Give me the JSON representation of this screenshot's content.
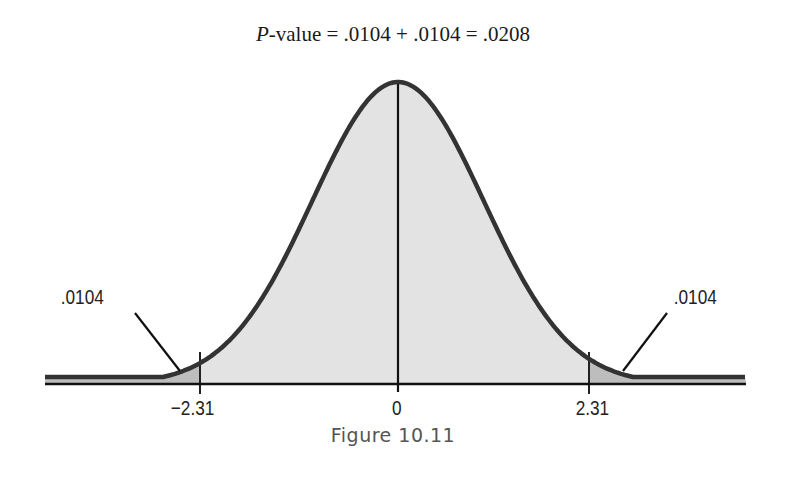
{
  "title": {
    "p": "P",
    "rest": "-value = .0104 + .0104 = .0208"
  },
  "caption": "Figure 10.11",
  "labels": {
    "left_area": ".0104",
    "right_area": ".0104",
    "tick_left": "−2.31",
    "tick_center": "0",
    "tick_right": "2.31"
  },
  "colors": {
    "body_fill": "#e3e3e3",
    "tail_fill": "#bdbdbd",
    "curve": "#333333"
  },
  "chart_data": {
    "type": "area",
    "title": "P-value = .0104 + .0104 = .0208",
    "subtitle": "",
    "caption": "Figure 10.11",
    "distribution": "standard normal",
    "xlabel": "",
    "ylabel": "",
    "x_ticks": [
      -2.31,
      0,
      2.31
    ],
    "x_tick_labels": [
      "−2.31",
      "0",
      "2.31"
    ],
    "shaded_regions": [
      {
        "name": "left tail",
        "from": "-inf",
        "to": -2.31,
        "area": 0.0104,
        "label": ".0104"
      },
      {
        "name": "right tail",
        "from": 2.31,
        "to": "inf",
        "area": 0.0104,
        "label": ".0104"
      }
    ],
    "p_value": 0.0208,
    "annotations": [
      ".0104",
      ".0104"
    ],
    "grid": false,
    "legend": "none"
  }
}
